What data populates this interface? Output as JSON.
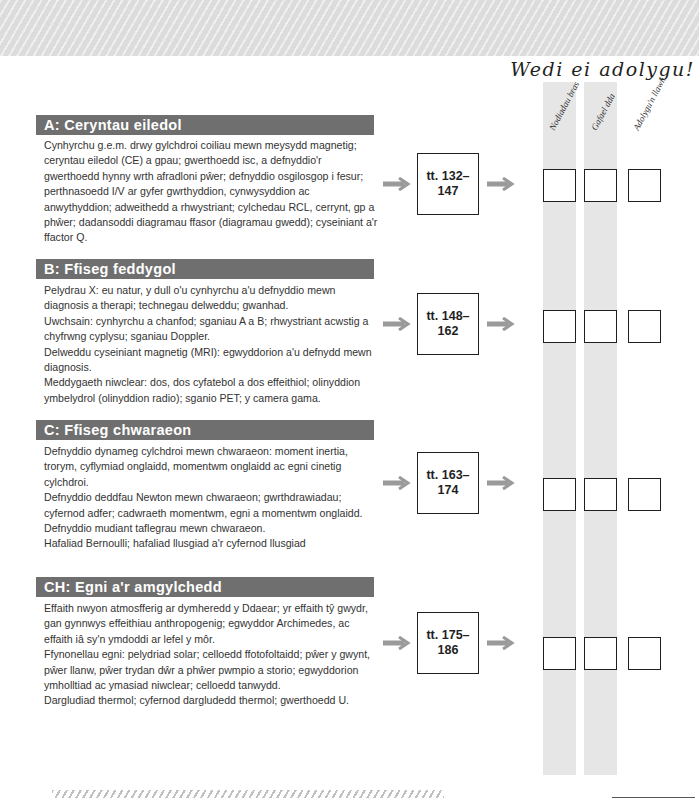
{
  "page": {
    "review_title": "Wedi ei adolygu!",
    "columns": [
      {
        "label": "Nodiadau bras"
      },
      {
        "label": "Gafael dda"
      },
      {
        "label": "Adolygu'n llawn"
      }
    ],
    "colors": {
      "header_bar": "#6f6f6f",
      "stripe": "#e6e6e6",
      "arrow": "#9a9a9a",
      "text": "#333333"
    }
  },
  "sections": [
    {
      "title": "A: Ceryntau eiledol",
      "pages": "tt. 132–\n147",
      "pages_line1": "tt. 132–",
      "pages_line2": "147",
      "paragraphs": [
        "Cynhyrchu g.e.m. drwy gylchdroi coiliau mewn meysydd magnetig; ceryntau eiledol (CE) a gpau; gwerthoedd isc, a defnyddio'r gwerthoedd hynny wrth afradloni pŵer; defnyddio osgilosgop i fesur; perthnasoedd I/V ar gyfer gwrthyddion, cynwysyddion ac anwythyddion; adweithedd a rhwystriant; cylchedau RCL, cerrynt, gp a phŵer; dadansoddi diagramau ffasor (diagramau gwedd); cyseiniant a'r ffactor Q."
      ]
    },
    {
      "title": "B: Ffiseg feddygol",
      "pages_line1": "tt. 148–",
      "pages_line2": "162",
      "paragraphs": [
        "Pelydrau X: eu natur, y dull o'u cynhyrchu a'u defnyddio mewn diagnosis a therapi; technegau delweddu; gwanhad.",
        "Uwchsain: cynhyrchu a chanfod; sganiau A a B; rhwystriant acwstig a chyfrwng cyplysu; sganiau Doppler.",
        "Delweddu cyseiniant magnetig (MRI): egwyddorion a'u defnydd mewn diagnosis.",
        "Meddygaeth niwclear: dos, dos cyfatebol a dos effeithiol; olinyddion ymbelydrol (olinyddion radio); sganio PET; y camera gama."
      ]
    },
    {
      "title": "C: Ffiseg chwaraeon",
      "pages_line1": "tt. 163–",
      "pages_line2": "174",
      "paragraphs": [
        "Defnyddio dynameg cylchdroi mewn chwaraeon: moment inertia, trorym, cyflymiad onglaidd, momentwm onglaidd ac egni cinetig cylchdroi.",
        "Defnyddio deddfau Newton mewn chwaraeon; gwrthdrawiadau; cyfernod adfer; cadwraeth momentwm, egni a momentwm onglaidd.",
        "Defnyddio mudiant taflegrau mewn chwaraeon.",
        "Hafaliad Bernoulli; hafaliad llusgiad a'r cyfernod llusgiad"
      ]
    },
    {
      "title": "CH: Egni a'r amgylchedd",
      "pages_line1": "tt. 175–",
      "pages_line2": "186",
      "paragraphs": [
        "Effaith nwyon atmosfferig ar dymheredd y Ddaear; yr effaith tŷ gwydr, gan gynnwys effeithiau anthropogenig; egwyddor Archimedes, ac effaith iâ sy'n ymdoddi ar lefel y môr.",
        "Ffynonellau egni: pelydriad solar; celloedd ffotofoltaidd; pŵer y gwynt, pŵer llanw, pŵer trydan dŵr a phŵer pwmpio a storio; egwyddorion ymholltiad ac ymasiad niwclear; celloedd tanwydd.",
        "Dargludiad thermol; cyfernod dargludedd thermol; gwerthoedd U."
      ]
    }
  ]
}
